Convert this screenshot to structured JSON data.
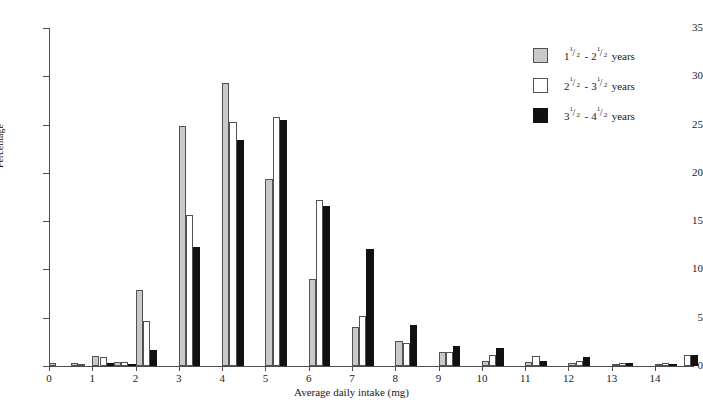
{
  "chart_data": {
    "type": "bar",
    "title": "",
    "xlabel": "Average daily intake (mg)",
    "ylabel": "Percentage",
    "xlim": [
      0,
      14.9
    ],
    "ylim": [
      0,
      35
    ],
    "ytick_step": 5,
    "bin_width": 0.5,
    "grid": false,
    "legend_position": "top-right",
    "xticks": [
      "0",
      "1",
      "2",
      "3",
      "4",
      "5",
      "6",
      "7",
      "8",
      "9",
      "10",
      "11",
      "12",
      "13",
      "14"
    ],
    "yticks": [
      "0",
      "5",
      "10",
      "15",
      "20",
      "25",
      "30",
      "35"
    ],
    "bin_starts": [
      0.0,
      0.5,
      1.0,
      1.5,
      2.0,
      2.5,
      3.0,
      3.5,
      4.0,
      4.5,
      5.0,
      5.5,
      6.0,
      6.5,
      7.0,
      7.5,
      8.0,
      8.5,
      9.0,
      9.5,
      10.0,
      10.5,
      11.0,
      11.5,
      12.0,
      12.5,
      13.0,
      13.5,
      14.0,
      14.5
    ],
    "series": [
      {
        "name": "1 1/2 - 2 1/2 years",
        "color": "#c9c9c9",
        "values": [
          0.3,
          0.3,
          1.0,
          0.4,
          7.9,
          0.0,
          24.9,
          0.0,
          29.3,
          0.0,
          19.4,
          0.0,
          9.0,
          0.0,
          4.0,
          0.0,
          2.6,
          0.0,
          1.5,
          0.0,
          0.5,
          0.0,
          0.4,
          0.0,
          0.3,
          0.0,
          0.2,
          0.0,
          0.2,
          0.0
        ]
      },
      {
        "name": "2 1/2 - 3 1/2 years",
        "color": "#ffffff",
        "values": [
          0.0,
          0.2,
          0.9,
          0.4,
          4.7,
          0.0,
          15.6,
          0.0,
          25.3,
          0.0,
          25.8,
          0.0,
          17.2,
          0.0,
          5.2,
          0.0,
          2.4,
          0.0,
          1.4,
          0.0,
          1.1,
          0.0,
          1.0,
          0.0,
          0.5,
          0.0,
          0.3,
          0.0,
          0.3,
          1.1
        ]
      },
      {
        "name": "3 1/2 - 4 1/2 years",
        "color": "#111111",
        "values": [
          0.0,
          0.0,
          0.3,
          0.1,
          1.7,
          0.0,
          12.3,
          0.0,
          23.4,
          0.0,
          25.5,
          0.0,
          16.6,
          0.0,
          12.1,
          0.0,
          4.2,
          0.0,
          2.1,
          0.0,
          1.9,
          0.0,
          0.5,
          0.0,
          0.9,
          0.0,
          0.3,
          0.0,
          0.2,
          1.1
        ]
      }
    ]
  },
  "legend": {
    "items": [
      {
        "swatch": "s0",
        "whole_a": "1",
        "num_a": "1",
        "den_a": "2",
        "dash": "-",
        "whole_b": "2",
        "num_b": "1",
        "den_b": "2",
        "unit": "years"
      },
      {
        "swatch": "s1",
        "whole_a": "2",
        "num_a": "1",
        "den_a": "2",
        "dash": "-",
        "whole_b": "3",
        "num_b": "1",
        "den_b": "2",
        "unit": "years"
      },
      {
        "swatch": "s2",
        "whole_a": "3",
        "num_a": "1",
        "den_a": "2",
        "dash": "-",
        "whole_b": "4",
        "num_b": "1",
        "den_b": "2",
        "unit": "years"
      }
    ]
  }
}
